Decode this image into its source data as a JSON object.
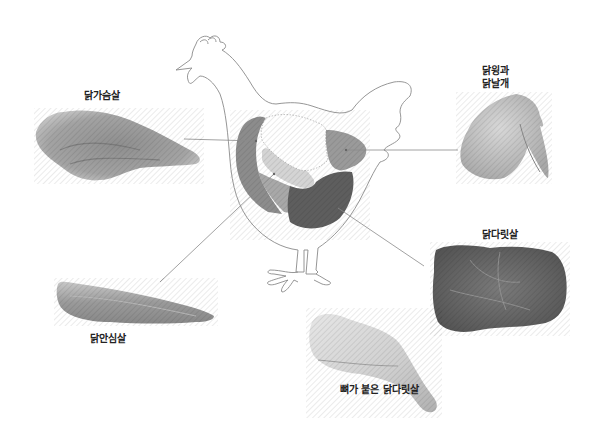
{
  "diagram": {
    "colors": {
      "outline": "#8a8a8a",
      "breast_region": "#8c8c8c",
      "tenderloin_region": "#d4d4d4",
      "wing_region": "#9a9a9a",
      "thigh_region": "#5e5e5e",
      "lower_breast_region": "#a8a8a8",
      "leader_line": "#8a8a8a"
    },
    "cuts": [
      {
        "id": "breast",
        "label": "닭가슴살",
        "photo": "raw chicken breast"
      },
      {
        "id": "wing",
        "label_line1": "닭윙과",
        "label_line2": "닭날개",
        "photo": "raw chicken wing"
      },
      {
        "id": "tenderloin",
        "label": "닭안심살",
        "photo": "raw chicken tenderloin"
      },
      {
        "id": "thigh",
        "label": "닭다릿살",
        "photo": "boneless chicken thigh"
      },
      {
        "id": "drumstick",
        "label": "뼈가 붙은 닭다릿살",
        "photo": "bone-in chicken leg"
      }
    ]
  }
}
